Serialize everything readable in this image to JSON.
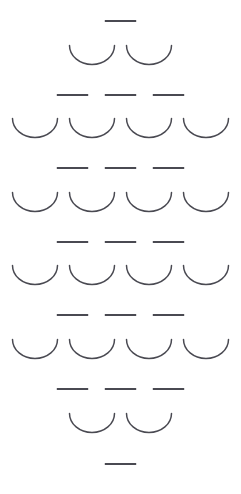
{
  "canvas": {
    "width": 241,
    "height": 494,
    "background_color": "#ffffff",
    "stroke_color": "#4a4a52",
    "description": "Abstract decorative pattern of alternating dash and arc glyph rows arranged in a vertically symmetric diamond shape"
  },
  "glyph_styles": {
    "dash": {
      "icon_name": "dash-glyph",
      "width": 33,
      "height": 8,
      "stroke_width": 1.9,
      "stroke_color": "#4a4a52",
      "gap": 15
    },
    "arc": {
      "icon_name": "arc-glyph",
      "width": 48,
      "height": 22,
      "stroke_width": 1.5,
      "stroke_color": "#4a4a52",
      "gap": 9
    }
  },
  "rows": [
    {
      "index": 1,
      "type": "dash",
      "count": 1,
      "top": 17,
      "label": "row-1-dash-single"
    },
    {
      "index": 2,
      "type": "arc",
      "count": 2,
      "top": 44,
      "label": "row-2-arc-pair"
    },
    {
      "index": 3,
      "type": "dash",
      "count": 3,
      "top": 91,
      "label": "row-3-dash-triple"
    },
    {
      "index": 4,
      "type": "arc",
      "count": 4,
      "top": 117,
      "label": "row-4-arc-quad"
    },
    {
      "index": 5,
      "type": "dash",
      "count": 3,
      "top": 164,
      "label": "row-5-dash-triple"
    },
    {
      "index": 6,
      "type": "arc",
      "count": 4,
      "top": 191,
      "label": "row-6-arc-quad"
    },
    {
      "index": 7,
      "type": "dash",
      "count": 3,
      "top": 238,
      "label": "row-7-dash-triple"
    },
    {
      "index": 8,
      "type": "arc",
      "count": 4,
      "top": 264,
      "label": "row-8-arc-quad"
    },
    {
      "index": 9,
      "type": "dash",
      "count": 3,
      "top": 311,
      "label": "row-9-dash-triple"
    },
    {
      "index": 10,
      "type": "arc",
      "count": 4,
      "top": 338,
      "label": "row-10-arc-quad"
    },
    {
      "index": 11,
      "type": "dash",
      "count": 3,
      "top": 385,
      "label": "row-11-dash-triple"
    },
    {
      "index": 12,
      "type": "arc",
      "count": 2,
      "top": 412,
      "label": "row-12-arc-pair"
    },
    {
      "index": 13,
      "type": "dash",
      "count": 1,
      "top": 460,
      "label": "row-13-dash-single"
    }
  ]
}
